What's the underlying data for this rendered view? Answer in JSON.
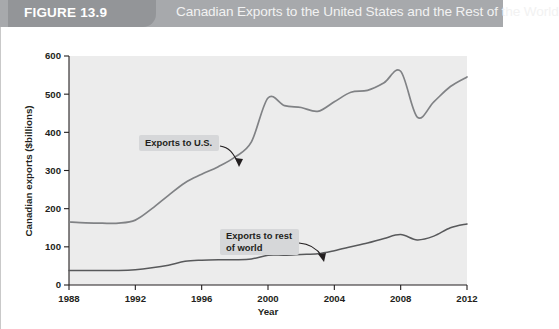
{
  "header": {
    "figure_tab_label": "FIGURE 13.9",
    "title": "Canadian Exports to the United States and the Rest of the World",
    "tab_color": "#939598",
    "banner_color": "#a7a9ac"
  },
  "chart_data": {
    "type": "line",
    "title": "Canadian Exports to the United States and the Rest of the World",
    "xlabel": "Year",
    "ylabel": "Canadian exports ($billions)",
    "xlim": [
      1988,
      2012
    ],
    "ylim": [
      0,
      600
    ],
    "xticks": [
      1988,
      1992,
      1996,
      2000,
      2004,
      2008,
      2012
    ],
    "yticks": [
      0,
      100,
      200,
      300,
      400,
      500,
      600
    ],
    "xtick_labels": [
      "1988",
      "1992",
      "1996",
      "2000",
      "2004",
      "2008",
      "2012"
    ],
    "ytick_labels": [
      "0",
      "100",
      "200",
      "300",
      "400",
      "500",
      "600"
    ],
    "grid": false,
    "legend": "annotations",
    "plot_background": "#ececec",
    "x": [
      1988,
      1989,
      1990,
      1991,
      1992,
      1993,
      1994,
      1995,
      1996,
      1997,
      1998,
      1999,
      2000,
      2001,
      2002,
      2003,
      2004,
      2005,
      2006,
      2007,
      2008,
      2009,
      2010,
      2011,
      2012
    ],
    "series": [
      {
        "name": "Exports to U.S.",
        "color": "#808285",
        "values": [
          165,
          163,
          162,
          162,
          170,
          200,
          235,
          268,
          290,
          310,
          335,
          375,
          490,
          470,
          465,
          455,
          480,
          505,
          510,
          530,
          560,
          440,
          480,
          520,
          545
        ]
      },
      {
        "name": "Exports to rest of world",
        "color": "#58595b",
        "values": [
          38,
          38,
          38,
          38,
          40,
          45,
          52,
          62,
          65,
          66,
          66,
          68,
          78,
          78,
          80,
          82,
          90,
          100,
          110,
          122,
          132,
          118,
          128,
          150,
          160
        ]
      }
    ],
    "annotations": [
      {
        "label": "Exports to U.S.",
        "lines": [
          "Exports to U.S."
        ],
        "points_to_year": 1998,
        "points_to_value": 335
      },
      {
        "label": "Exports to rest of world",
        "lines": [
          "Exports to rest",
          "of world"
        ],
        "points_to_year": 2004,
        "points_to_value": 90
      }
    ]
  }
}
